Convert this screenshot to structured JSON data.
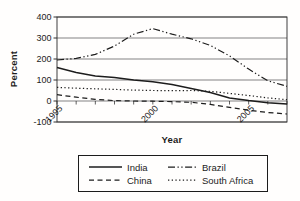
{
  "figure": {
    "background": "#fffefd",
    "ink_color": "#1c1c1c",
    "grid_color": "#4d4d4d"
  },
  "chart_data": {
    "type": "line",
    "title": "",
    "xlabel": "Year",
    "ylabel": "Percent",
    "ylim": [
      -100,
      400
    ],
    "yticks": [
      400,
      300,
      200,
      100,
      0,
      -100
    ],
    "x_range": [
      1995,
      2007
    ],
    "x_labeled_ticks": [
      1995,
      2000,
      2005
    ],
    "x": [
      1995,
      1996,
      1997,
      1998,
      1999,
      2000,
      2001,
      2002,
      2003,
      2004,
      2005,
      2006,
      2007
    ],
    "grid": true,
    "axis_cross_y": 0,
    "legend_position": "bottom",
    "series": [
      {
        "name": "India",
        "line_style": "solid",
        "values": [
          160,
          136,
          119,
          112,
          100,
          92,
          79,
          60,
          40,
          15,
          2,
          -8,
          -15
        ]
      },
      {
        "name": "Brazil",
        "line_style": "dash-dot-dot",
        "values": [
          195,
          203,
          222,
          262,
          318,
          345,
          318,
          296,
          265,
          215,
          152,
          96,
          70
        ]
      },
      {
        "name": "China",
        "line_style": "dashed",
        "values": [
          30,
          18,
          8,
          2,
          0,
          -1,
          -3,
          -6,
          -16,
          -30,
          -44,
          -55,
          -62
        ]
      },
      {
        "name": "South Africa",
        "line_style": "dotted",
        "values": [
          65,
          61,
          58,
          55,
          52,
          50,
          49,
          50,
          46,
          36,
          26,
          15,
          6
        ]
      }
    ]
  }
}
